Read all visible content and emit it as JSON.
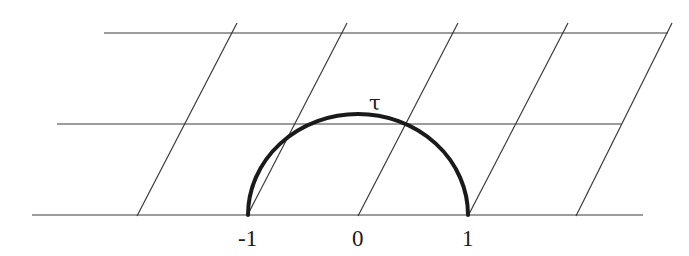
{
  "figure": {
    "labels": {
      "minus_one": "-1",
      "zero": "0",
      "one": "1",
      "tau": "τ"
    },
    "horizontal_lines": [
      {
        "name": "top",
        "x1": 104,
        "x2": 668,
        "y": 33
      },
      {
        "name": "middle",
        "x1": 57,
        "x2": 622,
        "y": 124
      },
      {
        "name": "bottom",
        "x1": 32,
        "x2": 643,
        "y": 215
      }
    ],
    "slanted_lines": [
      {
        "x1": 137,
        "y1": 216,
        "x2": 237,
        "y2": 23
      },
      {
        "x1": 247,
        "y1": 216,
        "x2": 347,
        "y2": 23
      },
      {
        "x1": 358,
        "y1": 216,
        "x2": 458,
        "y2": 23
      },
      {
        "x1": 468,
        "y1": 216,
        "x2": 568,
        "y2": 23
      },
      {
        "x1": 576,
        "y1": 216,
        "x2": 672,
        "y2": 23
      }
    ],
    "arc": {
      "cx": 358,
      "cy": 215,
      "r": 110
    }
  }
}
